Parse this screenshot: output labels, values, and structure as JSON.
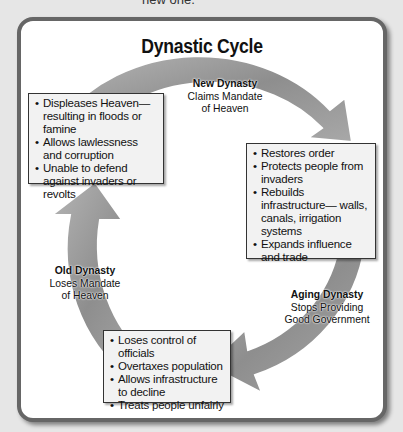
{
  "page": {
    "top_text": "new one."
  },
  "diagram": {
    "title": "Dynastic Cycle",
    "stages": [
      {
        "heading": "New Dynasty",
        "subheading_1": "Claims Mandate",
        "subheading_2": "of Heaven"
      },
      {
        "heading": "Aging Dynasty",
        "subheading_1": "Stops Providing",
        "subheading_2": "Good Government"
      },
      {
        "heading": "Old Dynasty",
        "subheading_1": "Loses Mandate",
        "subheading_2": "of Heaven"
      }
    ],
    "boxes": [
      {
        "items": [
          "Displeases Heaven— resulting in floods or famine",
          "Allows lawlessness and corruption",
          "Unable to defend against invaders or revolts"
        ]
      },
      {
        "items": [
          "Restores order",
          "Protects people from invaders",
          "Rebuilds infrastructure— walls, canals, irrigation systems",
          "Expands influence and trade"
        ]
      },
      {
        "items": [
          "Loses control of officials",
          "Overtaxes population",
          "Allows infrastructure to decline",
          "Treats people unfairly"
        ]
      }
    ],
    "colors": {
      "arrow_fill": "#9a9a9a",
      "arrow_edge": "#ffffff",
      "frame_border": "#666666",
      "box_fill": "#f2f2f2"
    }
  }
}
